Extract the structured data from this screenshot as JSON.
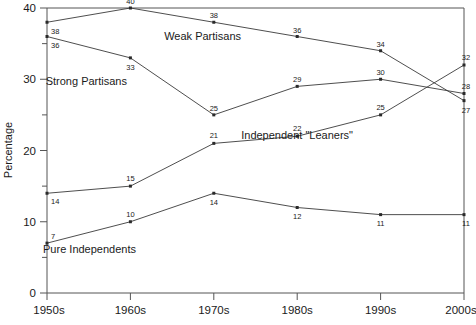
{
  "chart_data": {
    "type": "line",
    "title": "",
    "subtitle": "",
    "xlabel": "",
    "ylabel": "Percentage",
    "categories": [
      "1950s",
      "1960s",
      "1970s",
      "1980s",
      "1990s",
      "2000s"
    ],
    "xlim": [
      0,
      5
    ],
    "ylim": [
      0,
      40
    ],
    "yticks": [
      0,
      10,
      20,
      30,
      40
    ],
    "yticklabels": [
      "0",
      "10",
      "20",
      "30",
      "40"
    ],
    "yminorticks": [
      5,
      15,
      25,
      35
    ],
    "grid": false,
    "legend_position": "inline-annotations",
    "series": [
      {
        "name": "Weak Partisans",
        "values": [
          38,
          40,
          38,
          36,
          34,
          27
        ],
        "label_text": "Weak Partisans",
        "label_x": 241,
        "label_y": 40,
        "point_labels": [
          "38",
          "40",
          "38",
          "36",
          "34",
          "27"
        ],
        "point_label_offsets": [
          {
            "dx": 4,
            "dy": 12
          },
          {
            "dx": 0,
            "dy": -4
          },
          {
            "dx": 0,
            "dy": -4
          },
          {
            "dx": 0,
            "dy": -4
          },
          {
            "dx": 0,
            "dy": -4
          },
          {
            "dx": 2,
            "dy": 12
          }
        ],
        "point_label_anchor": [
          "start",
          "middle",
          "middle",
          "middle",
          "middle",
          "middle"
        ]
      },
      {
        "name": "Strong Partisans",
        "values": [
          36,
          33,
          25,
          29,
          30,
          28
        ],
        "label_text": "Strong Partisans",
        "label_x": 127,
        "label_y": 85,
        "point_labels": [
          "36",
          "33",
          "25",
          "29",
          "30",
          "28"
        ],
        "point_label_offsets": [
          {
            "dx": 4,
            "dy": 11
          },
          {
            "dx": 0,
            "dy": 12
          },
          {
            "dx": 0,
            "dy": -4
          },
          {
            "dx": 0,
            "dy": -4
          },
          {
            "dx": 0,
            "dy": -4
          },
          {
            "dx": 2,
            "dy": -5
          }
        ],
        "point_label_anchor": [
          "start",
          "middle",
          "middle",
          "middle",
          "middle",
          "middle"
        ]
      },
      {
        "name": "Independent \"Leaners\"",
        "values": [
          14,
          15,
          21,
          22,
          25,
          32
        ],
        "label_text": "Independent \"Leaners\"",
        "label_x": 353,
        "label_y": 139,
        "point_labels": [
          "14",
          "15",
          "21",
          "22",
          "25",
          "32"
        ],
        "point_label_offsets": [
          {
            "dx": 4,
            "dy": 11
          },
          {
            "dx": 0,
            "dy": -5
          },
          {
            "dx": 0,
            "dy": -5
          },
          {
            "dx": 0,
            "dy": -5
          },
          {
            "dx": 0,
            "dy": -5
          },
          {
            "dx": 2,
            "dy": -5
          }
        ],
        "point_label_anchor": [
          "start",
          "middle",
          "middle",
          "middle",
          "middle",
          "middle"
        ]
      },
      {
        "name": "Pure Independents",
        "values": [
          7,
          10,
          14,
          12,
          11,
          11
        ],
        "label_text": "Pure Independents",
        "label_x": 136,
        "label_y": 253,
        "point_labels": [
          "7",
          "10",
          "14",
          "12",
          "11",
          "11"
        ],
        "point_label_offsets": [
          {
            "dx": 4,
            "dy": -4
          },
          {
            "dx": 0,
            "dy": -5
          },
          {
            "dx": 0,
            "dy": 12
          },
          {
            "dx": 0,
            "dy": 11
          },
          {
            "dx": 0,
            "dy": 11
          },
          {
            "dx": 2,
            "dy": 11
          }
        ],
        "point_label_anchor": [
          "start",
          "middle",
          "middle",
          "middle",
          "middle",
          "middle"
        ]
      }
    ]
  },
  "axes": {
    "y_axis_title": "Percentage"
  },
  "caption": {
    "text": ""
  }
}
